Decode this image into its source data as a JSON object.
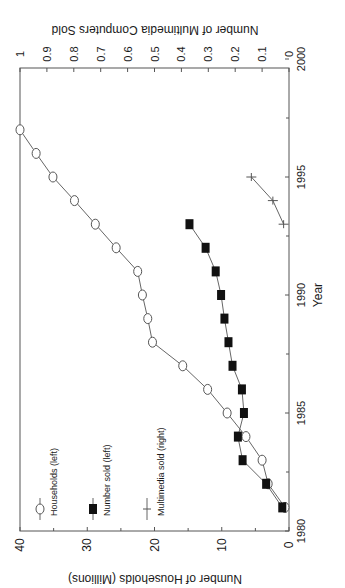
{
  "chart_data": {
    "type": "line",
    "orientation": "rotated 90deg counter-clockwise",
    "title": "",
    "xlabel": "Year",
    "ylabel_left": "Number of Households (Millions)",
    "ylabel_right": "Number of Multimedia Computers Sold",
    "xlim": [
      1980,
      2000
    ],
    "ylim_left": [
      0,
      40
    ],
    "ylim_right": [
      0,
      1
    ],
    "x_ticks": [
      1980,
      1985,
      1990,
      1995,
      2000
    ],
    "y_ticks_left": [
      0,
      10,
      20,
      30,
      40
    ],
    "y_ticks_right": [
      0,
      0.1,
      0.2,
      0.3,
      0.4,
      0.5,
      0.6,
      0.7,
      0.8,
      0.9,
      1
    ],
    "grid": false,
    "legend_position": "upper left (rotated)",
    "series": [
      {
        "name": "Households (left)",
        "axis": "left",
        "marker": "open-circle",
        "x": [
          1981,
          1982,
          1983,
          1984,
          1985,
          1986,
          1987,
          1988,
          1989,
          1990,
          1991,
          1992,
          1993,
          1994,
          1995,
          1996,
          1997
        ],
        "values": [
          0.6,
          3.1,
          4.0,
          6.4,
          9.2,
          12.1,
          15.8,
          20.3,
          21.0,
          21.8,
          22.5,
          25.7,
          28.8,
          31.9,
          35.1,
          37.6,
          40.0
        ]
      },
      {
        "name": "Number sold (left)",
        "axis": "left",
        "marker": "filled-square",
        "x": [
          1981,
          1982,
          1983,
          1984,
          1985,
          1986,
          1987,
          1988,
          1989,
          1990,
          1991,
          1992,
          1993
        ],
        "values": [
          1.0,
          3.4,
          6.9,
          7.6,
          6.7,
          7.0,
          8.4,
          9.0,
          9.6,
          10.1,
          10.9,
          12.4,
          14.8
        ]
      },
      {
        "name": "Multimedia sold (right)",
        "axis": "right",
        "marker": "plus",
        "x": [
          1993,
          1994,
          1995
        ],
        "values": [
          0.02,
          0.06,
          0.14
        ]
      }
    ]
  },
  "labels": {
    "xlabel": "Year",
    "ylabel_left": "Number of Households (Millions)",
    "ylabel_right": "Number of Multimedia Computers Sold",
    "legend": [
      "Households (left)",
      "Number sold (left)",
      "Multimedia sold (right)"
    ]
  }
}
